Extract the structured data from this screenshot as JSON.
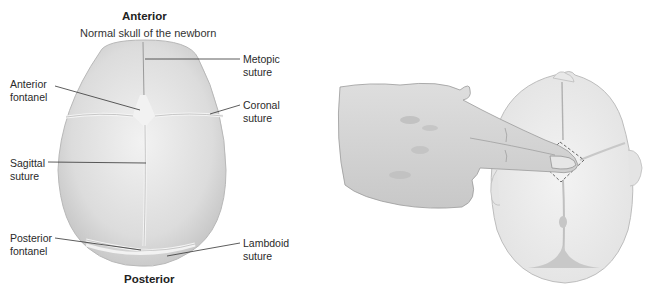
{
  "left_figure": {
    "top_heading": "Anterior",
    "subtitle": "Normal skull of the newborn",
    "bottom_heading": "Posterior",
    "labels": {
      "metopic_1": "Metopic",
      "metopic_2": "suture",
      "anterior_fontanel_1": "Anterior",
      "anterior_fontanel_2": "fontanel",
      "coronal_1": "Coronal",
      "coronal_2": "suture",
      "sagittal_1": "Sagittal",
      "sagittal_2": "suture",
      "posterior_fontanel_1": "Posterior",
      "posterior_fontanel_2": "fontanel",
      "lambdoid_1": "Lambdoid",
      "lambdoid_2": "suture"
    }
  },
  "right_figure": {
    "description": "Two fingers palpating the anterior fontanel of an infant skull (top view)"
  },
  "colors": {
    "skull_fill": "#e6e6e6",
    "skull_edge": "#bdbdbd",
    "suture": "#f4f4f4",
    "leader_line": "#333333",
    "hand_fill": "#d4d4d4"
  }
}
